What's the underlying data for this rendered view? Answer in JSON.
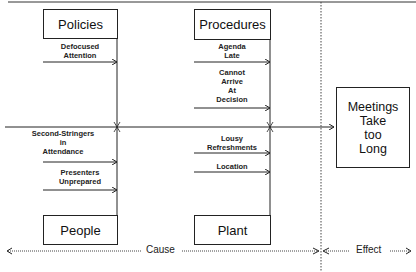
{
  "diagram": {
    "type": "fishbone",
    "categories": {
      "top_left": "Policies",
      "top_right": "Procedures",
      "bottom_left": "People",
      "bottom_right": "Plant"
    },
    "effect": "Meetings\nTake\ntoo\nLong",
    "causes": {
      "policies": [
        "Defocused\nAttention"
      ],
      "procedures": [
        "Agenda\nLate",
        "Cannot\nArrive\nAt\nDecision"
      ],
      "people": [
        "Second-Stringers\nin\nAttendance",
        "Presenters\nUnprepared"
      ],
      "plant": [
        "Lousy\nRefreshments",
        "Location"
      ]
    },
    "axis": {
      "cause_label": "Cause",
      "effect_label": "Effect"
    }
  }
}
